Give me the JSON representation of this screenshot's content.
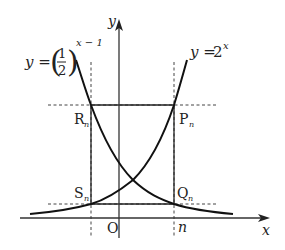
{
  "figure": {
    "type": "function-graph",
    "axes": {
      "x_label": "x",
      "y_label": "y",
      "origin_label": "O",
      "tick_label_n": "n"
    },
    "curves": [
      {
        "name": "exp-decay",
        "label_prefix": "y =",
        "label_base_numerator": "1",
        "label_base_denominator": "2",
        "label_exponent": "x − 1"
      },
      {
        "name": "exp-growth",
        "label_prefix": "y =",
        "label_base": "2",
        "label_exponent": "x"
      }
    ],
    "points": [
      {
        "name": "R",
        "subscript": "n"
      },
      {
        "name": "P",
        "subscript": "n"
      },
      {
        "name": "S",
        "subscript": "n"
      },
      {
        "name": "Q",
        "subscript": "n"
      }
    ]
  }
}
